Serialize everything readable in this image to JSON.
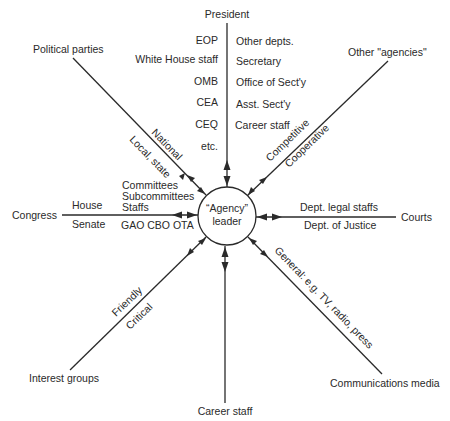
{
  "center": {
    "line1": "“Agency”",
    "line2": "leader"
  },
  "nodes": {
    "president": "President",
    "political_parties": "Political parties",
    "other_agencies": "Other \"agencies\"",
    "congress": "Congress",
    "courts": "Courts",
    "interest_groups": "Interest groups",
    "career_staff": "Career staff",
    "communications_media": "Communications media"
  },
  "president_spoke": {
    "left": [
      "EOP",
      "White House staff",
      "OMB",
      "CEA",
      "CEQ",
      "etc."
    ],
    "right": [
      "Other depts.",
      "Secretary",
      "Office of Sect'y",
      "Asst. Sect'y",
      "Career staff"
    ]
  },
  "political_parties_spoke": {
    "above": "National",
    "below": "Local, state"
  },
  "other_agencies_spoke": {
    "above": "Competitive",
    "below": "Cooperative"
  },
  "congress_spoke": {
    "above": "House",
    "below": "Senate",
    "inner_above": [
      "Committees",
      "Subcommittees",
      "Staffs"
    ],
    "inner_below": "GAO CBO OTA"
  },
  "courts_spoke": {
    "above": "Dept. legal staffs",
    "below": "Dept. of Justice"
  },
  "interest_groups_spoke": {
    "above": "Friendly",
    "below": "Critical"
  },
  "communications_spoke": {
    "label": "General: e.g. TV, radio, press"
  },
  "colors": {
    "ink": "#2a2a2a",
    "background": "#ffffff"
  }
}
